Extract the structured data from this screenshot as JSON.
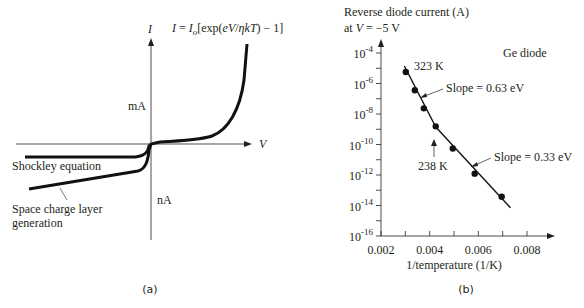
{
  "chart_data": [
    {
      "id": "a",
      "type": "line",
      "caption": "(a)",
      "title": "",
      "xlabel": "V",
      "ylabel": "I",
      "equation": {
        "lhs": "I",
        "eq": " = ",
        "io": "I",
        "io_sub": "o",
        "rhs": "[exp(",
        "ev": "eV",
        "slash": "/",
        "eta": "ηkT",
        "tail": ") − 1]"
      },
      "annotations": {
        "upper_unit": "mA",
        "lower_unit": "nA"
      },
      "series": [
        {
          "name": "Shockley equation",
          "description": "forward exponential rise (mA scale) and flat reverse saturation current (nA scale)"
        },
        {
          "name": "Space charge layer generation",
          "description": "reverse current growing with reverse bias"
        }
      ],
      "qualitative": true
    },
    {
      "id": "b",
      "type": "scatter",
      "caption": "(b)",
      "title": "Ge diode",
      "ylabel_line1": "Reverse diode current (A)",
      "ylabel_line2_prefix": "at ",
      "ylabel_line2_var": "V",
      "ylabel_line2_suffix": " = −5 V",
      "xlabel": "1/temperature (1/K)",
      "xscale": "linear",
      "yscale": "log",
      "xlim": [
        0.002,
        0.009
      ],
      "ylim_exp": [
        -16,
        -4
      ],
      "xticks": [
        0.002,
        0.003,
        0.004,
        0.005,
        0.006,
        0.007,
        0.008
      ],
      "xtick_labels": [
        {
          "value": 0.002,
          "label": "0.002"
        },
        {
          "value": 0.004,
          "label": "0.004"
        },
        {
          "value": 0.006,
          "label": "0.006"
        },
        {
          "value": 0.008,
          "label": "0.008"
        }
      ],
      "yticks_exp": [
        -16,
        -15,
        -14,
        -13,
        -12,
        -11,
        -10,
        -9,
        -8,
        -7,
        -6,
        -5,
        -4
      ],
      "ytick_labels": [
        {
          "exp": -4,
          "base": "10",
          "sup": "-4"
        },
        {
          "exp": -6,
          "base": "10",
          "sup": "-6"
        },
        {
          "exp": -8,
          "base": "10",
          "sup": "-8"
        },
        {
          "exp": -10,
          "base": "10",
          "sup": "-10"
        },
        {
          "exp": -12,
          "base": "10",
          "sup": "-12"
        },
        {
          "exp": -14,
          "base": "10",
          "sup": "-14"
        },
        {
          "exp": -16,
          "base": "10",
          "sup": "-16"
        }
      ],
      "points": [
        {
          "x": 0.00302,
          "log10_y": -5.25
        },
        {
          "x": 0.00339,
          "log10_y": -6.44
        },
        {
          "x": 0.00376,
          "log10_y": -7.63
        },
        {
          "x": 0.00425,
          "log10_y": -8.81
        },
        {
          "x": 0.00495,
          "log10_y": -10.26
        },
        {
          "x": 0.00585,
          "log10_y": -11.91
        },
        {
          "x": 0.00696,
          "log10_y": -13.43
        }
      ],
      "fit_lines": [
        {
          "name": "Slope = 0.63 eV",
          "from": {
            "x": 0.00296,
            "log10_y": -4.85
          },
          "to": {
            "x": 0.00425,
            "log10_y": -8.85
          }
        },
        {
          "name": "Slope = 0.33 eV",
          "from": {
            "x": 0.00425,
            "log10_y": -8.85
          },
          "to": {
            "x": 0.00732,
            "log10_y": -14.15
          }
        }
      ],
      "annotations": {
        "temp_high": "323 K",
        "temp_knee": "238 K",
        "slope_high": "Slope = 0.63 eV",
        "slope_low": "Slope = 0.33 eV"
      },
      "grid": false
    }
  ]
}
